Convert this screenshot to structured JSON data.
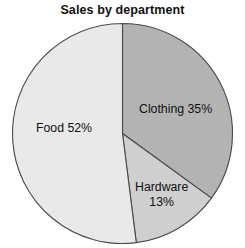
{
  "chart_data": {
    "type": "pie",
    "title": "Sales by department",
    "xlabel": "",
    "ylabel": "",
    "legend_position": "none",
    "grid": false,
    "start_angle_deg": 0,
    "direction": "clockwise",
    "categories": [
      "Clothing",
      "Hardware",
      "Food"
    ],
    "values": [
      35,
      13,
      52
    ],
    "unit": "%",
    "slices": [
      {
        "name": "Clothing",
        "value": 35,
        "label": "Clothing 35%",
        "label_lines": [
          "Clothing 35%"
        ],
        "color": "#b3b3b3",
        "start_deg": 0,
        "end_deg": 126
      },
      {
        "name": "Hardware",
        "value": 13,
        "label": "Hardware 13%",
        "label_lines": [
          "Hardware",
          "13%"
        ],
        "color": "#cfcfcf",
        "start_deg": 126,
        "end_deg": 172.8
      },
      {
        "name": "Food",
        "value": 52,
        "label": "Food 52%",
        "label_lines": [
          "Food 52%"
        ],
        "color": "#e9e9e9",
        "start_deg": 172.8,
        "end_deg": 360
      }
    ],
    "outline_color": "#4a4a4a",
    "background": "#ffffff"
  },
  "labels": {
    "clothing": "Clothing 35%",
    "food": "Food 52%",
    "hardware_name": "Hardware",
    "hardware_value": "13%"
  }
}
